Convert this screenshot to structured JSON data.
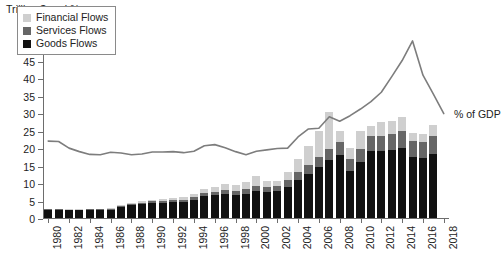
{
  "chart_data": {
    "type": "bar",
    "title": "Trillion $ and %",
    "xlabel": "",
    "ylabel": "Trillion $ and %",
    "ylim": [
      0,
      55
    ],
    "ytick_step": 5,
    "grid": false,
    "legend_position": "top-left-inside",
    "xtick_labels": [
      "1980",
      "1982",
      "1984",
      "1986",
      "1988",
      "1990",
      "1992",
      "1994",
      "1996",
      "1998",
      "2000",
      "2002",
      "2004",
      "2006",
      "2008",
      "2010",
      "2012",
      "2014",
      "2016",
      "2018"
    ],
    "xtick_label_interval": 2,
    "x": [
      1980,
      1981,
      1982,
      1983,
      1984,
      1985,
      1986,
      1987,
      1988,
      1989,
      1990,
      1991,
      1992,
      1993,
      1994,
      1995,
      1996,
      1997,
      1998,
      1999,
      2000,
      2001,
      2002,
      2003,
      2004,
      2005,
      2006,
      2007,
      2008,
      2009,
      2010,
      2011,
      2012,
      2013,
      2014,
      2015,
      2016,
      2017
    ],
    "categories": [
      "1980",
      "1981",
      "1982",
      "1983",
      "1984",
      "1985",
      "1986",
      "1987",
      "1988",
      "1989",
      "1990",
      "1991",
      "1992",
      "1993",
      "1994",
      "1995",
      "1996",
      "1997",
      "1998",
      "1999",
      "2000",
      "2001",
      "2002",
      "2003",
      "2004",
      "2005",
      "2006",
      "2007",
      "2008",
      "2009",
      "2010",
      "2011",
      "2012",
      "2013",
      "2014",
      "2015",
      "2016",
      "2017"
    ],
    "stacked": true,
    "series": [
      {
        "name": "Goods Flows",
        "color": "#111111",
        "values": [
          2.4,
          2.4,
          2.2,
          2.2,
          2.3,
          2.3,
          2.3,
          3.1,
          3.6,
          3.9,
          4.2,
          4.3,
          4.6,
          4.6,
          5.2,
          6.2,
          6.5,
          6.9,
          6.6,
          7.0,
          7.8,
          7.4,
          7.6,
          9.0,
          11.0,
          12.7,
          14.6,
          16.5,
          18.0,
          13.6,
          16.1,
          19.3,
          19.3,
          19.6,
          20.0,
          17.5,
          17.1,
          18.3
        ]
      },
      {
        "name": "Services Flows",
        "color": "#666666",
        "values": [
          0.2,
          0.2,
          0.2,
          0.2,
          0.2,
          0.2,
          0.3,
          0.4,
          0.4,
          0.5,
          0.6,
          0.6,
          0.7,
          0.7,
          0.8,
          1.0,
          1.1,
          1.2,
          1.2,
          1.3,
          1.5,
          1.5,
          1.6,
          1.8,
          2.2,
          2.5,
          2.9,
          3.4,
          3.8,
          3.2,
          3.7,
          4.2,
          4.3,
          4.5,
          4.8,
          4.6,
          4.7,
          5.1
        ]
      },
      {
        "name": "Financial Flows",
        "color": "#cfcfcf",
        "values": [
          0.1,
          0.1,
          0.1,
          0.1,
          0.1,
          0.1,
          0.2,
          0.3,
          0.3,
          0.4,
          0.5,
          0.5,
          0.5,
          0.6,
          0.8,
          1.1,
          1.3,
          1.6,
          1.6,
          2.0,
          2.6,
          1.6,
          1.5,
          2.4,
          3.8,
          5.3,
          7.4,
          10.4,
          3.0,
          3.2,
          5.1,
          3.0,
          3.9,
          3.6,
          4.0,
          2.4,
          2.4,
          3.3
        ]
      }
    ],
    "line_series": {
      "name": "% of GDP",
      "label": "% of GDP",
      "color": "#7d7d7d",
      "values": [
        22.3,
        22.2,
        20.3,
        19.3,
        18.5,
        18.4,
        19.1,
        19.2,
        18.5,
        19.1,
        19.3,
        19.2,
        19.4,
        19.3,
        20.2,
        21.3,
        21.1,
        20.7,
        19.9,
        18.5,
        19.5,
        20.1,
        20.3,
        21.8,
        24.1,
        26.2,
        29.3,
        28.0,
        29.8,
        31.3,
        33.5,
        36.2,
        40.8,
        45.5,
        51.0,
        41.0,
        30.3,
        36.0,
        36.2,
        34.0,
        33.2,
        32.9,
        32.2,
        31.1,
        31.4,
        31.3
      ]
    },
    "line_points": [
      {
        "year": 1980,
        "value": 22.3
      },
      {
        "year": 1981,
        "value": 22.2
      },
      {
        "year": 1982,
        "value": 20.3
      },
      {
        "year": 1983,
        "value": 19.3
      },
      {
        "year": 1984,
        "value": 18.5
      },
      {
        "year": 1985,
        "value": 18.4
      },
      {
        "year": 1986,
        "value": 19.1
      },
      {
        "year": 1987,
        "value": 18.9
      },
      {
        "year": 1988,
        "value": 18.4
      },
      {
        "year": 1989,
        "value": 18.6
      },
      {
        "year": 1990,
        "value": 19.2
      },
      {
        "year": 1991,
        "value": 19.2
      },
      {
        "year": 1992,
        "value": 19.3
      },
      {
        "year": 1993,
        "value": 19.0
      },
      {
        "year": 1994,
        "value": 19.4
      },
      {
        "year": 1995,
        "value": 21.0
      },
      {
        "year": 1996,
        "value": 21.3
      },
      {
        "year": 1997,
        "value": 20.4
      },
      {
        "year": 1998,
        "value": 19.3
      },
      {
        "year": 1999,
        "value": 18.4
      },
      {
        "year": 2000,
        "value": 19.4
      },
      {
        "year": 2001,
        "value": 19.8
      },
      {
        "year": 2002,
        "value": 20.2
      },
      {
        "year": 2003,
        "value": 20.3
      },
      {
        "year": 2004,
        "value": 23.5
      },
      {
        "year": 2005,
        "value": 25.8
      },
      {
        "year": 2006,
        "value": 26.0
      },
      {
        "year": 2007,
        "value": 29.3
      },
      {
        "year": 2008,
        "value": 28.0
      },
      {
        "year": 2009,
        "value": 29.6
      },
      {
        "year": 2010,
        "value": 31.5
      },
      {
        "year": 2011,
        "value": 33.6
      },
      {
        "year": 2012,
        "value": 36.3
      },
      {
        "year": 2013,
        "value": 40.8
      },
      {
        "year": 2014,
        "value": 45.4
      },
      {
        "year": 2015,
        "value": 51.0
      },
      {
        "year": 2016,
        "value": 41.2
      },
      {
        "year": 2017,
        "value": 35.8
      },
      {
        "year": 2018,
        "value": 30.2
      }
    ],
    "annotations": [
      {
        "text": "% of GDP",
        "x": 2018,
        "y": 31.5
      }
    ]
  },
  "legend": {
    "items": [
      {
        "label": "Financial Flows",
        "color": "#cfcfcf"
      },
      {
        "label": "Services Flows",
        "color": "#666666"
      },
      {
        "label": "Goods Flows",
        "color": "#111111"
      }
    ]
  },
  "axis": {
    "y_title": "Trillion $ and %",
    "y_ticks": [
      "0",
      "5",
      "10",
      "15",
      "20",
      "25",
      "30",
      "35",
      "40",
      "45",
      "50",
      "55"
    ],
    "x_ticks": [
      "1980",
      "1982",
      "1984",
      "1986",
      "1988",
      "1990",
      "1992",
      "1994",
      "1996",
      "1998",
      "2000",
      "2002",
      "2004",
      "2006",
      "2008",
      "2010",
      "2012",
      "2014",
      "2016",
      "2018"
    ]
  }
}
